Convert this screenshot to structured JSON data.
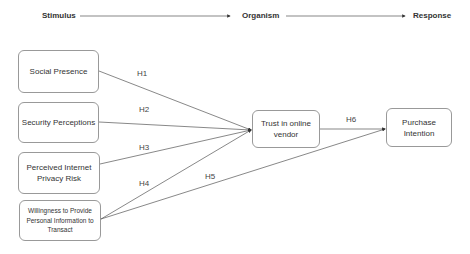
{
  "stages": [
    {
      "label": "Stimulus"
    },
    {
      "label": "Organism"
    },
    {
      "label": "Response"
    }
  ],
  "constructs": {
    "social_presence": "Social Presence",
    "security_perceptions": "Security Perceptions",
    "privacy_risk": "Perceived Internet Privacy Risk",
    "willingness": "Willingness to Provide Personal Information to Transact",
    "trust": "Trust in online vendor",
    "purchase_intention": "Purchase Intention"
  },
  "hypotheses": {
    "h1": "H1",
    "h2": "H2",
    "h3": "H3",
    "h4": "H4",
    "h5": "H5",
    "h6": "H6"
  },
  "colors": {
    "line": "#555555",
    "border": "#999999",
    "text": "#333333"
  }
}
